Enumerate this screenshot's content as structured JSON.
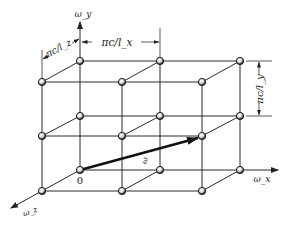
{
  "figure": {
    "type": "3D lattice of allowed wave-vector modes in omega-space",
    "axes": {
      "y_label": "ω_y",
      "x_label": "ω_x",
      "z_label": "ω_z"
    },
    "origin_label": "0",
    "vector_label": "ω",
    "dimensions": {
      "x_spacing": "πc/l_x",
      "y_spacing": "πc/l_y",
      "z_spacing": "πc/l_z"
    },
    "lattice": {
      "nx": 3,
      "ny": 3,
      "nz": 2,
      "back_nodes_x": [
        80,
        160,
        240
      ],
      "back_nodes_y": [
        61,
        116,
        170
      ],
      "depth_offset": [
        -38,
        21
      ]
    },
    "colors": {
      "line": "#2a2a2a",
      "node_fill": "#ffffff",
      "node_stroke": "#1a1a1a",
      "background": "#ffffff"
    }
  }
}
